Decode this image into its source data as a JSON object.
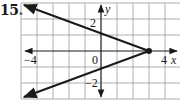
{
  "problem": {
    "number": "15."
  },
  "graph": {
    "grid": {
      "x_min": -5,
      "x_max": 5,
      "y_min": -3,
      "y_max": 3,
      "step": 1
    },
    "axes": {
      "x_label": "x",
      "y_label": "y"
    },
    "tick_labels": {
      "x_neg": "−4",
      "origin": "0",
      "x_pos": "4",
      "y_pos": "2",
      "y_neg": "−2"
    },
    "vertex": {
      "x": 3,
      "y": 0
    },
    "rays": [
      {
        "name": "upper-ray",
        "from": [
          3,
          0
        ],
        "to": [
          -5,
          3
        ]
      },
      {
        "name": "lower-ray",
        "from": [
          3,
          0
        ],
        "to": [
          -5,
          -3
        ]
      }
    ],
    "colors": {
      "grid": "#9a9a9a",
      "axis": "#1a1a1a",
      "line": "#1a1a1a"
    }
  }
}
